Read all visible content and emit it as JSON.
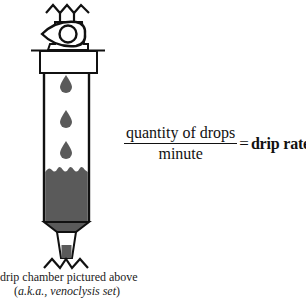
{
  "diagram": {
    "subject": "drip chamber",
    "drops_count": 3,
    "colors": {
      "stroke": "#111111",
      "fluid": "#5a5a5a",
      "drop": "#5a5a5a",
      "background": "#ffffff"
    }
  },
  "formula": {
    "numerator": "quantity of drops",
    "denominator": "minute",
    "equals": "=",
    "result": "drip rate"
  },
  "caption": {
    "line1": "drip chamber pictured above",
    "line2_open": "(",
    "line2_italic": "a.k.a., venoclysis set",
    "line2_close": ")"
  }
}
